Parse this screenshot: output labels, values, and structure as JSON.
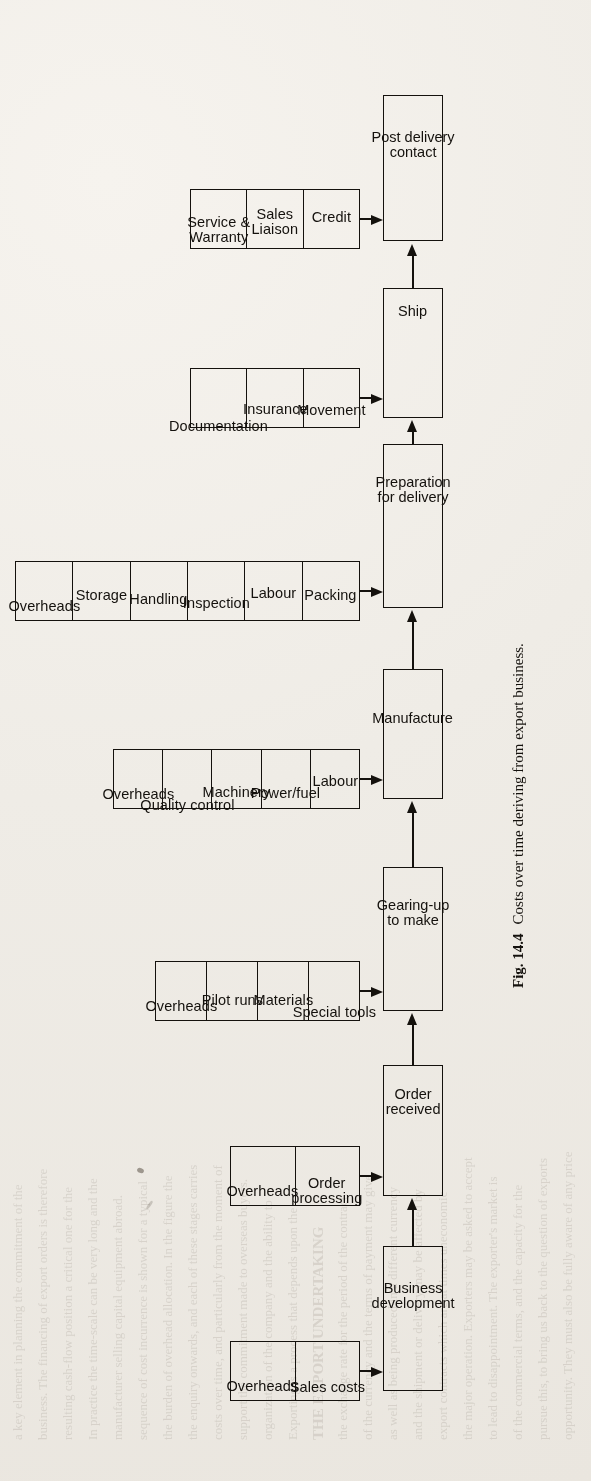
{
  "figure": {
    "caption_label": "Fig. 14.4",
    "caption_text": "Costs over time deriving from export business.",
    "orientation": "rotated-90",
    "ink_color": "#14110d",
    "paper_color": "#efece6"
  },
  "flow": {
    "stages": [
      {
        "id": "business-development",
        "node_label": "Business\ndevelopment",
        "cost_group": [
          "Overheads",
          "Sales costs"
        ]
      },
      {
        "id": "order-received",
        "node_label": "Order\nreceived",
        "cost_group": [
          "Overheads",
          "Order\nprocessing"
        ]
      },
      {
        "id": "gearing-up-to-make",
        "node_label": "Gearing-up\nto make",
        "cost_group": [
          "Overheads",
          "Pilot runs",
          "Materials",
          "Special tools"
        ]
      },
      {
        "id": "manufacture",
        "node_label": "Manufacture",
        "cost_group": [
          "Overheads",
          "Quality control",
          "Machinery",
          "Power/fuel",
          "Labour"
        ]
      },
      {
        "id": "preparation-for-delivery",
        "node_label": "Preparation\nfor delivery",
        "cost_group": [
          "Overheads",
          "Storage",
          "Handling",
          "Inspection",
          "Labour",
          "Packing"
        ]
      },
      {
        "id": "ship",
        "node_label": "Ship",
        "cost_group": [
          "Documentation",
          "Insurance",
          "Movement"
        ]
      },
      {
        "id": "post-delivery-contact",
        "node_label": "Post delivery\ncontact",
        "cost_group": [
          "Service &\nWarranty",
          "Sales\nLiaison",
          "Credit"
        ]
      }
    ]
  },
  "background_text": {
    "lines": [
      "opportunity. They must also be fully aware of any price",
      "pursue this, to bring us back to the question of exports",
      "of the commercial terms, and the capacity for the",
      "to lead to disappointment. The exporter's market is",
      "the major operation. Exporters may be asked to accept",
      "export contracts which are at times uneconomic",
      "and the shipment or delivery may be affected by",
      "as well as being produced in a different currency",
      "of the currency and the terms of payment may give",
      "the exchange rate for the period of the contract.",
      "THE EXPORT UNDERTAKING",
      "Exporting is a process that depends upon the",
      "organization of the company and the ability to",
      "support the commitment made to overseas buyers.",
      "costs over time, and particularly from the moment of",
      "the enquiry onwards, and each of these stages carries",
      "the burden of overhead allocation. In the figure the",
      "sequence of cost incurrence is shown for a typical",
      "manufacturer selling capital equipment abroad.",
      "In practice the time-scale can be very long and the",
      "resulting cash-flow position a critical one for the",
      "business. The financing of export orders is therefore",
      "a key element in planning the commitment of the",
      "company to a particular market or customer."
    ]
  }
}
